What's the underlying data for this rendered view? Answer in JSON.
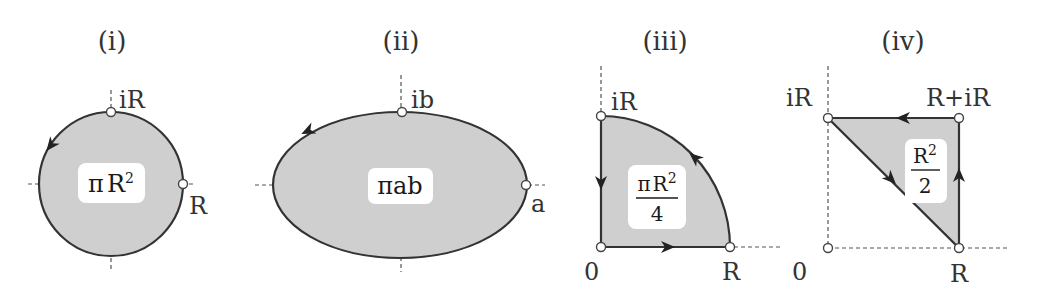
{
  "panels": [
    {
      "id": "i",
      "title": "(i)",
      "shape": "circle",
      "area_label": {
        "pi": "π",
        "base": "R",
        "exp": "2"
      },
      "points": {
        "top": "iR",
        "right": "R"
      },
      "orientation": "counterclockwise"
    },
    {
      "id": "ii",
      "title": "(ii)",
      "shape": "ellipse",
      "area_label": {
        "text": "πab"
      },
      "points": {
        "top": "ib",
        "right": "a"
      },
      "orientation": "counterclockwise"
    },
    {
      "id": "iii",
      "title": "(iii)",
      "shape": "quarter-disc",
      "area_label": {
        "num_pi": "π",
        "num_base": "R",
        "num_exp": "2",
        "den": "4"
      },
      "points": {
        "top": "iR",
        "origin": "0",
        "right": "R"
      },
      "orientation": "counterclockwise"
    },
    {
      "id": "iv",
      "title": "(iv)",
      "shape": "triangle",
      "area_label": {
        "num_base": "R",
        "num_exp": "2",
        "den": "2"
      },
      "points": {
        "top_left": "iR",
        "top_right": "R+iR",
        "origin": "0",
        "bottom_right": "R"
      },
      "orientation": "counterclockwise"
    }
  ],
  "colors": {
    "fill": "#cfcfcf",
    "stroke": "#333333",
    "label_box": "#ffffff"
  }
}
